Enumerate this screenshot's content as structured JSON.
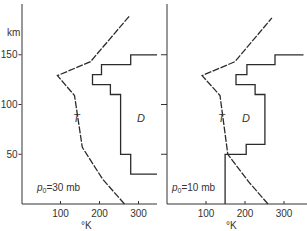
{
  "chart_data": [
    {
      "type": "line",
      "title": "",
      "annotation": "p0 = 30 mb",
      "annotation_parts": {
        "symbol": "p",
        "subscript": "0",
        "rest": "=30 mb"
      },
      "xlabel": "°K",
      "ylabel": "km",
      "xlim": [
        0,
        350
      ],
      "ylim": [
        0,
        195
      ],
      "x_ticks": [
        100,
        200,
        300
      ],
      "y_ticks": [
        50,
        100,
        150
      ],
      "grid": false,
      "series": [
        {
          "name": "T",
          "style": "dashed-solid",
          "points": [
            [
              264,
              0
            ],
            [
              208,
              25
            ],
            [
              156,
              57
            ],
            [
              136,
              109
            ],
            [
              92,
              129
            ],
            [
              177,
              143
            ],
            [
              277,
              189
            ]
          ]
        },
        {
          "name": "D",
          "style": "step",
          "points": [
            [
              350,
              30
            ],
            [
              280,
              30
            ],
            [
              280,
              50
            ],
            [
              254,
              50
            ],
            [
              254,
              110
            ],
            [
              228,
              110
            ],
            [
              228,
              120
            ],
            [
              182,
              120
            ],
            [
              182,
              130
            ],
            [
              205,
              130
            ],
            [
              205,
              140
            ],
            [
              280,
              140
            ],
            [
              280,
              150
            ],
            [
              350,
              150
            ]
          ]
        }
      ]
    },
    {
      "type": "line",
      "title": "",
      "annotation": "p0 = 10 mb",
      "annotation_parts": {
        "symbol": "p",
        "subscript": "0",
        "rest": "=10 mb"
      },
      "xlabel": "°K",
      "ylabel": "",
      "xlim": [
        0,
        350
      ],
      "ylim": [
        0,
        195
      ],
      "x_ticks": [
        100,
        200,
        300
      ],
      "y_ticks": [
        50,
        100,
        150
      ],
      "grid": false,
      "series": [
        {
          "name": "T",
          "style": "dashed-solid",
          "points": [
            [
              259,
              0
            ],
            [
              210,
              22
            ],
            [
              156,
              50
            ],
            [
              136,
              109
            ],
            [
              90,
              129
            ],
            [
              174,
              143
            ],
            [
              269,
              187
            ]
          ]
        },
        {
          "name": "D",
          "style": "step",
          "points": [
            [
              149,
              0
            ],
            [
              149,
              50
            ],
            [
              203,
              50
            ],
            [
              203,
              60
            ],
            [
              251,
              60
            ],
            [
              251,
              110
            ],
            [
              226,
              110
            ],
            [
              226,
              120
            ],
            [
              177,
              120
            ],
            [
              177,
              130
            ],
            [
              205,
              130
            ],
            [
              205,
              140
            ],
            [
              277,
              140
            ],
            [
              277,
              150
            ],
            [
              350,
              150
            ]
          ]
        }
      ]
    }
  ],
  "labels": {
    "y_unit": "km",
    "x_unit": "°K",
    "y_tick_labels": [
      "150",
      "100",
      "50"
    ],
    "x_tick_labels": [
      "100",
      "200",
      "300"
    ],
    "left_annotation_rest": "=30 mb",
    "right_annotation_rest": "=10 mb",
    "annotation_symbol": "p",
    "annotation_subscript": "0",
    "curve_t": "T",
    "curve_d": "D"
  }
}
